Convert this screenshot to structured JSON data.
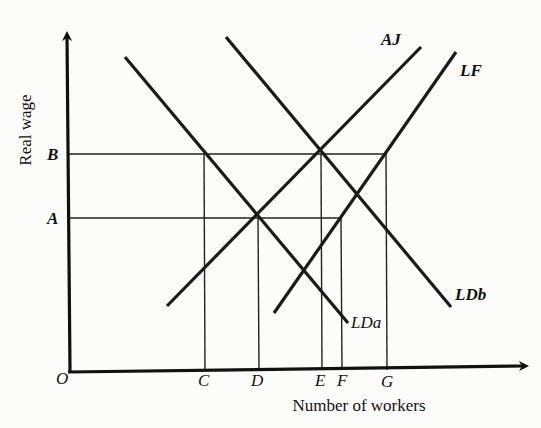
{
  "diagram": {
    "title": "",
    "y_axis_label": "Real wage",
    "x_axis_label": "Number of workers",
    "origin_label": "O",
    "y_ticks": [
      {
        "label": "B",
        "y": 154
      },
      {
        "label": "A",
        "y": 218
      }
    ],
    "x_ticks": [
      {
        "label": "C",
        "x": 204
      },
      {
        "label": "D",
        "x": 258
      },
      {
        "label": "E",
        "x": 321
      },
      {
        "label": "F",
        "x": 341
      },
      {
        "label": "G",
        "x": 387
      }
    ],
    "curves": [
      {
        "name": "LDa",
        "type": "labour demand (a)",
        "x1": 125,
        "y1": 57,
        "x2": 348,
        "y2": 323
      },
      {
        "name": "LDb",
        "type": "labour demand (b)",
        "x1": 226,
        "y1": 37,
        "x2": 451,
        "y2": 307
      },
      {
        "name": "AJ",
        "type": "accept job supply",
        "x1": 167,
        "y1": 306,
        "x2": 421,
        "y2": 47
      },
      {
        "name": "LF",
        "type": "labour force",
        "x1": 274,
        "y1": 313,
        "x2": 456,
        "y2": 52
      }
    ],
    "curve_labels": {
      "LDa": "LDa",
      "LDb": "LDb",
      "AJ": "AJ",
      "LF": "LF"
    },
    "colors": {
      "line": "#1a1a1a",
      "background": "#fcfcfa"
    }
  }
}
